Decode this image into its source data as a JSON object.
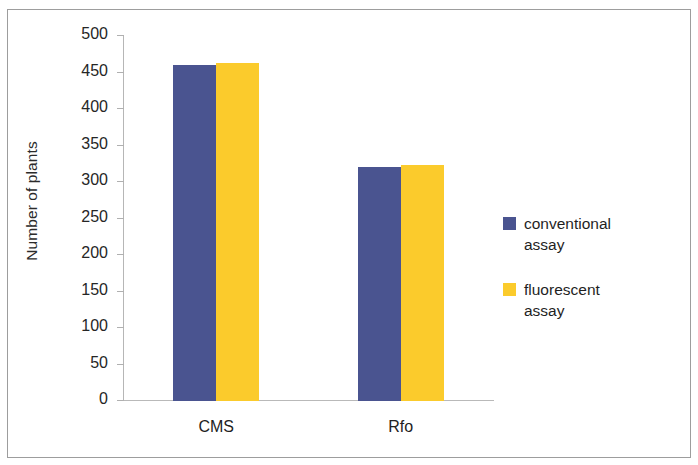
{
  "chart_data": {
    "type": "bar",
    "title": "",
    "xlabel": "",
    "ylabel": "Number of plants",
    "categories": [
      "CMS",
      "Rfo"
    ],
    "series": [
      {
        "name": "conventional assay",
        "values": [
          460,
          320
        ],
        "color": "#4a5490"
      },
      {
        "name": "fluorescent assay",
        "values": [
          463,
          323
        ],
        "color": "#fbcb2c"
      }
    ],
    "ylim": [
      0,
      500
    ],
    "yticks": [
      0,
      50,
      100,
      150,
      200,
      250,
      300,
      350,
      400,
      450,
      500
    ],
    "ytick_labels": [
      "0",
      "50",
      "100",
      "150",
      "200",
      "250",
      "300",
      "350",
      "400",
      "450",
      "500"
    ],
    "grid": false,
    "legend_position": "right"
  },
  "axes": {
    "y_title": "Number of plants",
    "ticks": [
      {
        "label": "500",
        "value": 500
      },
      {
        "label": "450",
        "value": 450
      },
      {
        "label": "400",
        "value": 400
      },
      {
        "label": "350",
        "value": 350
      },
      {
        "label": "300",
        "value": 300
      },
      {
        "label": "250",
        "value": 250
      },
      {
        "label": "200",
        "value": 200
      },
      {
        "label": "150",
        "value": 150
      },
      {
        "label": "100",
        "value": 100
      },
      {
        "label": "50",
        "value": 50
      },
      {
        "label": "0",
        "value": 0
      }
    ],
    "categories": [
      {
        "label": "CMS"
      },
      {
        "label": "Rfo"
      }
    ]
  },
  "legend": {
    "entries": [
      {
        "label_line1": "conventional",
        "label_line2": "assay",
        "color": "#4a5490"
      },
      {
        "label_line1": "fluorescent",
        "label_line2": "assay",
        "color": "#fbcb2c"
      }
    ]
  }
}
